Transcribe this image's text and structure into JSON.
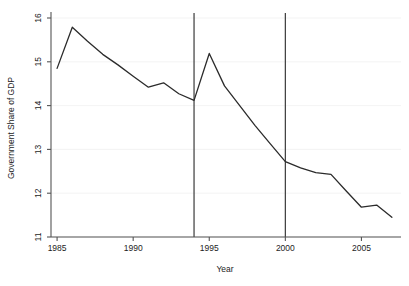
{
  "chart_data": {
    "type": "line",
    "title": "",
    "xlabel": "Year",
    "ylabel": "Government Share of GDP",
    "xlim": [
      1984.6,
      2007.6
    ],
    "ylim": [
      11,
      16
    ],
    "grid": true,
    "legend": false,
    "x": [
      1985,
      1986,
      1987,
      1988,
      1989,
      1990,
      1991,
      1992,
      1993,
      1994,
      1995,
      1996,
      1997,
      1998,
      1999,
      2000,
      2001,
      2002,
      2003,
      2004,
      2005,
      2006,
      2007
    ],
    "xticks": [
      1985,
      1990,
      1995,
      2000,
      2005
    ],
    "xtick_labels": [
      "1985",
      "1990",
      "1995",
      "2000",
      "2005"
    ],
    "yticks": [
      11,
      12,
      13,
      14,
      15,
      16
    ],
    "ytick_labels": [
      "11",
      "12",
      "13",
      "14",
      "15",
      "16"
    ],
    "series": [
      {
        "name": "Government Share of GDP",
        "color": "#2b2b2b",
        "values": [
          14.85,
          15.79,
          15.47,
          15.17,
          14.93,
          14.67,
          14.42,
          14.52,
          14.27,
          14.12,
          15.19,
          14.45,
          14.0,
          13.55,
          13.13,
          12.72,
          12.58,
          12.47,
          12.43,
          12.05,
          11.68,
          11.73,
          11.45
        ]
      }
    ],
    "annotations": [
      {
        "type": "vline",
        "x": 1994,
        "color": "#3a3a3a"
      },
      {
        "type": "vline",
        "x": 2000,
        "color": "#3a3a3a"
      }
    ]
  }
}
